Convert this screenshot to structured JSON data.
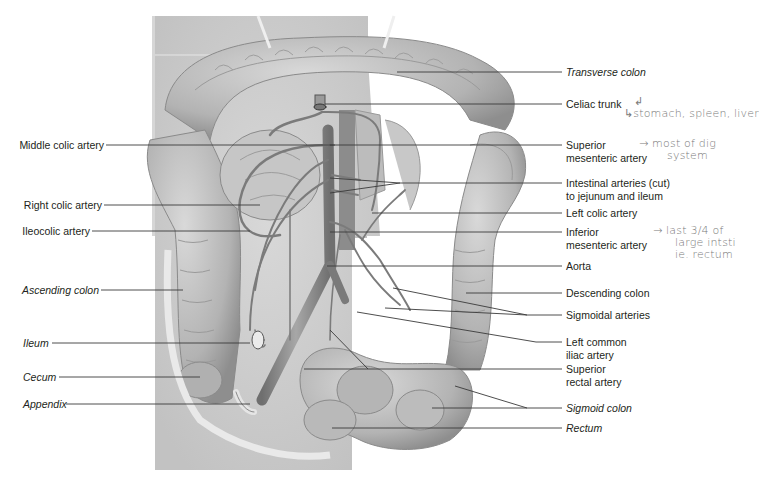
{
  "figure": {
    "left_labels": [
      {
        "id": "middle-colic-artery",
        "text": "Middle colic artery",
        "italic": false
      },
      {
        "id": "right-colic-artery",
        "text": "Right colic artery",
        "italic": false
      },
      {
        "id": "ileocolic-artery",
        "text": "Ileocolic artery",
        "italic": false
      },
      {
        "id": "ascending-colon",
        "text": "Ascending colon",
        "italic": true
      },
      {
        "id": "ileum",
        "text": "Ileum",
        "italic": true
      },
      {
        "id": "cecum",
        "text": "Cecum",
        "italic": true
      },
      {
        "id": "appendix",
        "text": "Appendix",
        "italic": true
      }
    ],
    "right_labels": [
      {
        "id": "transverse-colon",
        "lines": [
          "Transverse colon"
        ],
        "italic": true
      },
      {
        "id": "celiac-trunk",
        "lines": [
          "Celiac trunk"
        ],
        "italic": false
      },
      {
        "id": "superior-mesenteric-artery",
        "lines": [
          "Superior",
          "mesenteric artery"
        ],
        "italic": false
      },
      {
        "id": "intestinal-arteries",
        "lines": [
          "Intestinal arteries (cut)",
          "to jejunum and ileum"
        ],
        "italic": false
      },
      {
        "id": "left-colic-artery",
        "lines": [
          "Left colic artery"
        ],
        "italic": false
      },
      {
        "id": "inferior-mesenteric-artery",
        "lines": [
          "Inferior",
          "mesenteric artery"
        ],
        "italic": false
      },
      {
        "id": "aorta",
        "lines": [
          "Aorta"
        ],
        "italic": false
      },
      {
        "id": "descending-colon",
        "lines": [
          "Descending colon"
        ],
        "italic": false
      },
      {
        "id": "sigmoidal-arteries",
        "lines": [
          "Sigmoidal arteries"
        ],
        "italic": false
      },
      {
        "id": "left-common-iliac-artery",
        "lines": [
          "Left common",
          "iliac artery"
        ],
        "italic": false
      },
      {
        "id": "superior-rectal-artery",
        "lines": [
          "Superior",
          "rectal artery"
        ],
        "italic": false
      },
      {
        "id": "sigmoid-colon",
        "lines": [
          "Sigmoid colon"
        ],
        "italic": true
      },
      {
        "id": "rectum",
        "lines": [
          "Rectum"
        ],
        "italic": true
      }
    ],
    "handwritten_notes": [
      {
        "id": "note-celiac",
        "lines": [
          "↲",
          "↳stomach, spleen, liver"
        ]
      },
      {
        "id": "note-superior-mesenteric",
        "lines": [
          "→ most of dig",
          "system"
        ]
      },
      {
        "id": "note-inferior-mesenteric",
        "lines": [
          "→ last 3/4 of",
          "large intsti",
          "ie. rectum"
        ]
      }
    ]
  },
  "colors": {
    "background": "#ffffff",
    "text": "#231f20",
    "leader_line": "#3a3a3a",
    "illustration_base": "#cfcfcf",
    "illustration_shadow": "#8f8f8f",
    "artery": "#7d7d7d",
    "handwriting": "#7a7a7a"
  }
}
